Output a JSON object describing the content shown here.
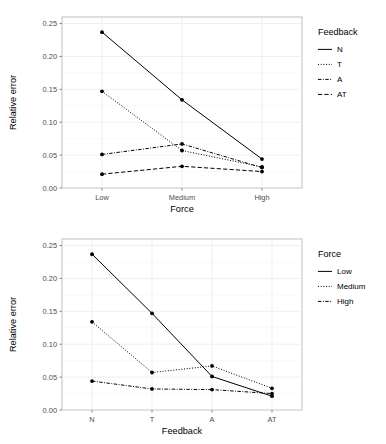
{
  "figure": {
    "panels": [
      {
        "id": "top",
        "xlabel": "Force",
        "ylabel": "Relative error",
        "legend_title": "Feedback",
        "x_ticks": [
          "Low",
          "Medium",
          "High"
        ],
        "y_ticks": [
          "0.00",
          "0.05",
          "0.10",
          "0.15",
          "0.20",
          "0.25"
        ]
      },
      {
        "id": "bottom",
        "xlabel": "Feedback",
        "ylabel": "Relative error",
        "legend_title": "Force",
        "x_ticks": [
          "N",
          "T",
          "A",
          "AT"
        ],
        "y_ticks": [
          "0.00",
          "0.05",
          "0.10",
          "0.15",
          "0.20",
          "0.25"
        ]
      }
    ]
  },
  "chart_data": [
    {
      "type": "line",
      "title": "",
      "xlabel": "Force",
      "ylabel": "Relative error",
      "categories": [
        "Low",
        "Medium",
        "High"
      ],
      "ylim": [
        0.0,
        0.26
      ],
      "yticks": [
        0.0,
        0.05,
        0.1,
        0.15,
        0.2,
        0.25
      ],
      "grid": true,
      "legend_title": "Feedback",
      "legend_position": "right",
      "markers": "filled-circle",
      "series": [
        {
          "name": "N",
          "values": [
            0.237,
            0.134,
            0.044
          ],
          "linestyle": "solid",
          "color": "#000000"
        },
        {
          "name": "T",
          "values": [
            0.147,
            0.057,
            0.032
          ],
          "linestyle": "dotted",
          "color": "#000000"
        },
        {
          "name": "A",
          "values": [
            0.051,
            0.067,
            0.031
          ],
          "linestyle": "dashdot",
          "color": "#000000"
        },
        {
          "name": "AT",
          "values": [
            0.021,
            0.033,
            0.025
          ],
          "linestyle": "dashed",
          "color": "#000000"
        }
      ]
    },
    {
      "type": "line",
      "title": "",
      "xlabel": "Feedback",
      "ylabel": "Relative error",
      "categories": [
        "N",
        "T",
        "A",
        "AT"
      ],
      "ylim": [
        0.0,
        0.26
      ],
      "yticks": [
        0.0,
        0.05,
        0.1,
        0.15,
        0.2,
        0.25
      ],
      "grid": true,
      "legend_title": "Force",
      "legend_position": "right",
      "markers": "filled-circle",
      "series": [
        {
          "name": "Low",
          "values": [
            0.237,
            0.147,
            0.051,
            0.021
          ],
          "linestyle": "solid",
          "color": "#000000"
        },
        {
          "name": "Medium",
          "values": [
            0.134,
            0.057,
            0.067,
            0.033
          ],
          "linestyle": "dotted",
          "color": "#000000"
        },
        {
          "name": "High",
          "values": [
            0.044,
            0.032,
            0.031,
            0.025
          ],
          "linestyle": "dashdot",
          "color": "#000000"
        }
      ]
    }
  ]
}
